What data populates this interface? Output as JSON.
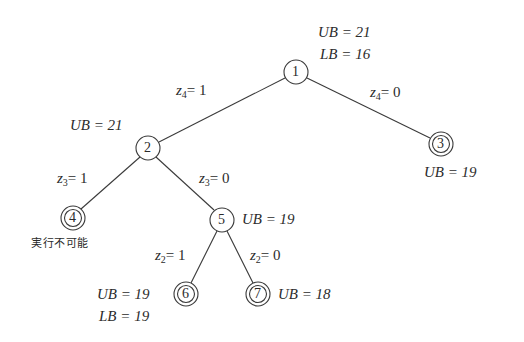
{
  "diagram": {
    "type": "branch-and-bound tree",
    "nodes": [
      {
        "id": "1",
        "label": "1",
        "cx": 296,
        "cy": 72,
        "terminal": false,
        "bounds": [
          "UB = 21",
          "LB = 16"
        ]
      },
      {
        "id": "2",
        "label": "2",
        "cx": 148,
        "cy": 148,
        "terminal": false,
        "bounds": [
          "UB = 21"
        ]
      },
      {
        "id": "3",
        "label": "3",
        "cx": 441,
        "cy": 144,
        "terminal": true,
        "bounds": [
          "UB = 19"
        ]
      },
      {
        "id": "4",
        "label": "4",
        "cx": 73,
        "cy": 218,
        "terminal": true,
        "note": "実行不可能"
      },
      {
        "id": "5",
        "label": "5",
        "cx": 222,
        "cy": 220,
        "terminal": false,
        "bounds": [
          "UB = 19"
        ]
      },
      {
        "id": "6",
        "label": "6",
        "cx": 186,
        "cy": 294,
        "terminal": true,
        "bounds": [
          "UB = 19",
          "LB = 19"
        ]
      },
      {
        "id": "7",
        "label": "7",
        "cx": 258,
        "cy": 294,
        "terminal": true,
        "bounds": [
          "UB = 18"
        ]
      }
    ],
    "edges": [
      {
        "from": "1",
        "to": "2",
        "var": "z",
        "sub": "4",
        "value": "1"
      },
      {
        "from": "1",
        "to": "3",
        "var": "z",
        "sub": "4",
        "value": "0"
      },
      {
        "from": "2",
        "to": "4",
        "var": "z",
        "sub": "3",
        "value": "1"
      },
      {
        "from": "2",
        "to": "5",
        "var": "z",
        "sub": "3",
        "value": "0"
      },
      {
        "from": "5",
        "to": "6",
        "var": "z",
        "sub": "2",
        "value": "1"
      },
      {
        "from": "5",
        "to": "7",
        "var": "z",
        "sub": "2",
        "value": "0"
      }
    ]
  },
  "labels": {
    "n1_ub": "UB = 21",
    "n1_lb": "LB = 16",
    "n2_ub": "UB = 21",
    "n3_ub": "UB = 19",
    "n4_note": "実行不可能",
    "n5_ub": "UB = 19",
    "n6_ub": "UB = 19",
    "n6_lb": "LB = 19",
    "n7_ub": "UB = 18",
    "e12": {
      "var": "z",
      "sub": "4",
      "rhs": "= 1"
    },
    "e13": {
      "var": "z",
      "sub": "4",
      "rhs": "= 0"
    },
    "e24": {
      "var": "z",
      "sub": "3",
      "rhs": "= 1"
    },
    "e25": {
      "var": "z",
      "sub": "3",
      "rhs": "= 0"
    },
    "e56": {
      "var": "z",
      "sub": "2",
      "rhs": "= 1"
    },
    "e57": {
      "var": "z",
      "sub": "2",
      "rhs": "= 0"
    },
    "node_numbers": [
      "1",
      "2",
      "3",
      "4",
      "5",
      "6",
      "7"
    ]
  },
  "colors": {
    "line": "#3a3a3a",
    "text": "#2b2b2b",
    "background": "#ffffff"
  }
}
